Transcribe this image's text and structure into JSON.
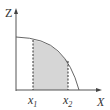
{
  "diagram": {
    "axes": {
      "y_label": "Z",
      "x_label": "X"
    },
    "markers": [
      {
        "label": "x",
        "sub": "1"
      },
      {
        "label": "x",
        "sub": "2"
      }
    ],
    "colors": {
      "line": "#444444",
      "shade": "#d6d6d6",
      "axis": "#555555"
    }
  }
}
